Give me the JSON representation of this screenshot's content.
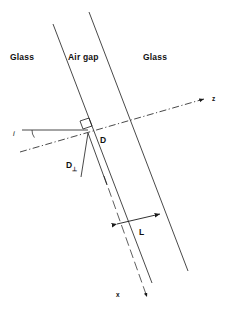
{
  "figure": {
    "type": "optics-ray-diagram",
    "width": 225,
    "height": 311,
    "background_color": "#ffffff",
    "line_color": "#1a1a1a",
    "text_color": "#111111"
  },
  "labels": {
    "glass_left": "Glass",
    "air_gap": "Air gap",
    "glass_right": "Glass",
    "d": "D",
    "d_perp": "D",
    "d_perp_subscript": "⊥",
    "l": "L",
    "z_axis": "z",
    "x_axis": "x",
    "angle_i": "i"
  },
  "geometry": {
    "gap_boundary_left": {
      "x1": 53,
      "y1": 24,
      "x2": 152,
      "y2": 283
    },
    "gap_boundary_right": {
      "x1": 89,
      "y1": 12,
      "x2": 188,
      "y2": 271
    },
    "z_axis_line": {
      "x1": 20,
      "y1": 152,
      "x2": 208,
      "y2": 98,
      "style": "dash-dot"
    },
    "z_arrow_tip": {
      "x": 208,
      "y": 98
    },
    "x_axis_line": {
      "x1": 104,
      "y1": 176,
      "x2": 148,
      "y2": 300,
      "style": "dashed"
    },
    "x_arrow_tip": {
      "x": 148,
      "y": 300
    },
    "horizontal_ray": {
      "x1": 22,
      "y1": 130,
      "x2": 88,
      "y2": 130
    },
    "angle_arc_center": {
      "x": 88,
      "y": 130
    },
    "right_angle_marker": {
      "x": 83,
      "y": 118,
      "size": 10
    },
    "d_perp_segment": {
      "x1": 88,
      "y1": 133,
      "x2": 80,
      "y2": 176
    },
    "d_segment": {
      "x1": 88,
      "y1": 133,
      "x2": 106,
      "y2": 182
    },
    "l_dimension": {
      "x1": 114,
      "y1": 225,
      "x2": 163,
      "y2": 213
    }
  }
}
